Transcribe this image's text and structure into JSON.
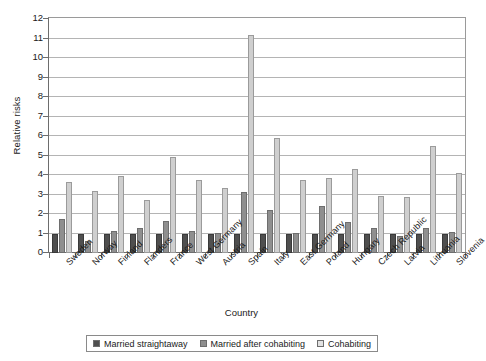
{
  "chart_data": {
    "type": "bar",
    "title": "",
    "xlabel": "Country",
    "ylabel": "Relative risks",
    "ylim": [
      0,
      12
    ],
    "ytick_step": 1,
    "yticks": [
      0,
      1,
      2,
      3,
      4,
      5,
      6,
      7,
      8,
      9,
      10,
      11,
      12
    ],
    "grid": "horizontal",
    "legend_position": "bottom",
    "categories": [
      "Sweden",
      "Norway",
      "Finland",
      "Flanders",
      "France",
      "West Germany",
      "Austria",
      "Spain",
      "Italy",
      "East Germany",
      "Poland",
      "Hungary",
      "Czech Republic",
      "Latvia",
      "Lithuania",
      "Slovenia"
    ],
    "series": [
      {
        "name": "Married straightaway",
        "color": "#4f4f4f",
        "values": [
          1.0,
          1.0,
          1.0,
          1.0,
          1.0,
          1.0,
          1.0,
          1.0,
          1.0,
          1.0,
          1.0,
          1.0,
          1.0,
          1.0,
          1.0,
          1.0
        ]
      },
      {
        "name": "Married after cohabiting",
        "color": "#8f8f8f",
        "values": [
          1.75,
          0.62,
          1.13,
          1.28,
          1.65,
          1.12,
          1.05,
          3.12,
          2.22,
          1.05,
          2.4,
          1.6,
          1.3,
          0.85,
          1.3,
          1.1
        ]
      },
      {
        "name": "Cohabiting",
        "color": "#cfcfcf",
        "values": [
          3.62,
          3.2,
          3.95,
          2.72,
          4.9,
          3.72,
          3.35,
          11.2,
          5.9,
          3.75,
          3.85,
          4.3,
          2.9,
          2.85,
          5.5,
          4.1
        ]
      }
    ]
  },
  "axes": {
    "y_title": "Relative risks",
    "x_title": "Country"
  },
  "legend": {
    "items": [
      {
        "label": "Married straightaway",
        "swatch": "s0"
      },
      {
        "label": "Married after cohabiting",
        "swatch": "s1"
      },
      {
        "label": "Cohabiting",
        "swatch": "s2"
      }
    ]
  }
}
